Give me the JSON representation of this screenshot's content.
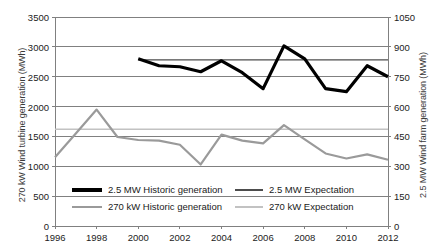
{
  "chart_data": {
    "type": "line",
    "title": "",
    "xlabel": "",
    "ylabel": "270 kW Wind turbine generation (MWh)",
    "y2label": "2.5 MW Wind farm generation (MWh)",
    "grid": true,
    "legend_position": "inside-bottom",
    "x": [
      1996,
      1997,
      1998,
      1999,
      2000,
      2001,
      2002,
      2003,
      2004,
      2005,
      2006,
      2007,
      2008,
      2009,
      2010,
      2011,
      2012
    ],
    "xtick_labels": [
      "1996",
      "1998",
      "2000",
      "2002",
      "2004",
      "2006",
      "2008",
      "2010",
      "2012"
    ],
    "xticks": [
      1996,
      1998,
      2000,
      2002,
      2004,
      2006,
      2008,
      2010,
      2012
    ],
    "xlim": [
      1996,
      2012
    ],
    "ylim": [
      0,
      3500
    ],
    "yticks": [
      0,
      500,
      1000,
      1500,
      2000,
      2500,
      3000,
      3500
    ],
    "ytick_labels": [
      "0",
      "500",
      "1000",
      "1500",
      "2000",
      "2500",
      "3000",
      "3500"
    ],
    "y2lim": [
      0,
      1050
    ],
    "y2ticks": [
      0,
      150,
      300,
      450,
      600,
      750,
      900,
      1050
    ],
    "y2tick_labels": [
      "0",
      "150",
      "300",
      "450",
      "600",
      "750",
      "900",
      "1050"
    ],
    "series": [
      {
        "name": "2.5 MW Historic generation",
        "axis": "right",
        "color": "#000000",
        "width": 3.2,
        "x": [
          2000,
          2001,
          2002,
          2003,
          2004,
          2005,
          2006,
          2007,
          2008,
          2009,
          2010,
          2011,
          2012
        ],
        "values": [
          840,
          805,
          800,
          775,
          830,
          770,
          690,
          905,
          840,
          690,
          675,
          805,
          750
        ]
      },
      {
        "name": "2.5 MW Expectation",
        "axis": "right",
        "color": "#4d4d4d",
        "width": 1.3,
        "x": [
          2000,
          2012
        ],
        "values": [
          835,
          835
        ]
      },
      {
        "name": "270 kW Historic generation",
        "axis": "left",
        "color": "#9a9a9a",
        "width": 2.2,
        "x": [
          1996,
          1997,
          1998,
          1999,
          2000,
          2001,
          2002,
          2003,
          2004,
          2005,
          2006,
          2007,
          2008,
          2009,
          2010,
          2011,
          2012
        ],
        "values": [
          1150,
          1550,
          1950,
          1490,
          1440,
          1430,
          1360,
          1030,
          1530,
          1430,
          1385,
          1690,
          1450,
          1215,
          1130,
          1200,
          1110
        ]
      },
      {
        "name": "270 kW Expectation",
        "axis": "left",
        "color": "#c2c2c2",
        "width": 1.3,
        "x": [
          1996,
          2012
        ],
        "values": [
          1620,
          1620
        ]
      }
    ]
  },
  "legend": {
    "entries": [
      {
        "label": "2.5 MW Historic generation",
        "color": "#000000",
        "thickness": 3.4
      },
      {
        "label": "2.5 MW Expectation",
        "color": "#4d4d4d",
        "thickness": 1.6
      },
      {
        "label": "270 kW Historic generation",
        "color": "#9a9a9a",
        "thickness": 2.2
      },
      {
        "label": "270 kW Expectation",
        "color": "#c2c2c2",
        "thickness": 1.6
      }
    ]
  },
  "colors": {
    "axis": "#808080",
    "grid": "#808080",
    "text": "#222222",
    "background": "#ffffff"
  }
}
